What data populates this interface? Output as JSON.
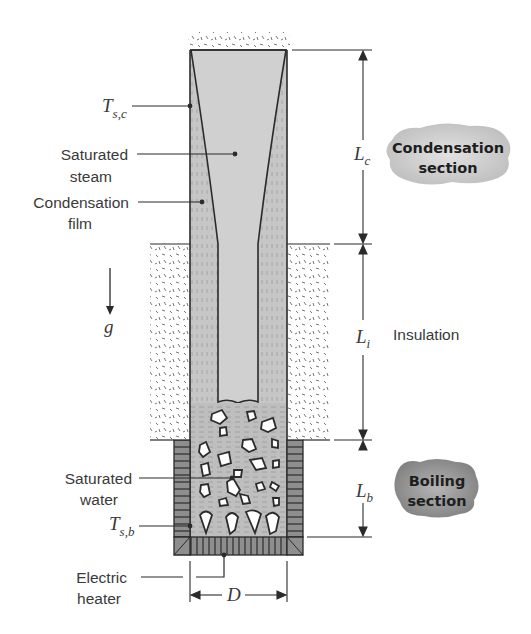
{
  "figure": {
    "labels": {
      "T_sc": {
        "symbol": "T",
        "subscript": "s,c"
      },
      "saturated_steam": [
        "Saturated",
        "steam"
      ],
      "condensation_film": [
        "Condensation",
        "film"
      ],
      "gravity": "g",
      "saturated_water": [
        "Saturated",
        "water"
      ],
      "T_sb": {
        "symbol": "T",
        "subscript": "s,b"
      },
      "electric_heater": [
        "Electric",
        "heater"
      ],
      "insulation": "Insulation",
      "diameter": "D"
    },
    "dimensions": {
      "L_c": {
        "symbol": "L",
        "subscript": "c"
      },
      "L_i": {
        "symbol": "L",
        "subscript": "i"
      },
      "L_b": {
        "symbol": "L",
        "subscript": "b"
      }
    },
    "badges": {
      "condensation": [
        "Condensation",
        "section"
      ],
      "boiling": [
        "Boiling",
        "section"
      ]
    },
    "colors": {
      "pipe_fill": "#c9c9c9",
      "steam_fill": "#d2d2d2",
      "water_fill": "#bdbdbd",
      "outline": "#2b2b2b",
      "text": "#3a3a3a",
      "badge_fill": "#c8c8c8",
      "boiling_badge_fill": "#9a9a9a"
    }
  }
}
